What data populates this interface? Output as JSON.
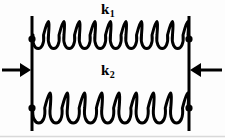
{
  "figure": {
    "name": "two-parallel-springs-diagram",
    "width": 225,
    "height": 138,
    "background_color": "#fdfdfd",
    "ink_color": "#000000"
  },
  "labels": {
    "spring_top": {
      "base": "k",
      "sub": "1",
      "full": "k1"
    },
    "spring_bottom": {
      "base": "k",
      "sub": "2",
      "full": "k2"
    }
  },
  "diagram": {
    "walls": [
      {
        "name": "left-wall",
        "x": 32,
        "y_top": 16,
        "y_bottom": 131,
        "thickness": 3
      },
      {
        "name": "right-wall",
        "x": 189,
        "y_top": 16,
        "y_bottom": 131,
        "thickness": 3
      }
    ],
    "nodes": [
      {
        "name": "top-left-node",
        "x": 32,
        "y": 39,
        "r": 3.6
      },
      {
        "name": "top-right-node",
        "x": 189,
        "y": 39,
        "r": 3.6
      },
      {
        "name": "bottom-left-node",
        "x": 32,
        "y": 108,
        "r": 3.6
      },
      {
        "name": "bottom-right-node",
        "x": 189,
        "y": 108,
        "r": 3.6
      }
    ],
    "springs": [
      {
        "name": "spring-k1",
        "label": "k1",
        "x_start": 33,
        "x_end": 188,
        "y_center": 35,
        "amplitude": 18,
        "coils": 10,
        "stroke": 3
      },
      {
        "name": "spring-k2",
        "label": "k2",
        "x_start": 33,
        "x_end": 188,
        "y_center": 108,
        "amplitude": 20,
        "coils": 9,
        "stroke": 3
      }
    ],
    "force_arrows": [
      {
        "name": "left-force-arrow",
        "direction": "right",
        "tail_x": 2,
        "head_x": 31,
        "y": 70,
        "shaft_thickness": 3,
        "head_length": 11,
        "head_half_width": 7
      },
      {
        "name": "right-force-arrow",
        "direction": "left",
        "tail_x": 222,
        "head_x": 190,
        "y": 70,
        "shaft_thickness": 3,
        "head_length": 11,
        "head_half_width": 7
      }
    ],
    "bottom_rule": {
      "name": "page-bottom-rule",
      "y": 136,
      "color": "#d9d9d9"
    }
  }
}
